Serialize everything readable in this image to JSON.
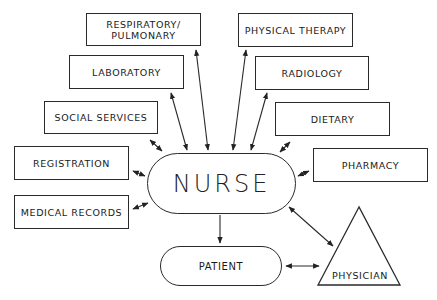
{
  "diagram": {
    "center": {
      "label": "NURSE"
    },
    "departments": [
      {
        "id": "respiratory",
        "label": "RESPIRATORY/ PULMONARY",
        "line1": "RESPIRATORY/",
        "line2": "PULMONARY"
      },
      {
        "id": "laboratory",
        "label": "LABORATORY"
      },
      {
        "id": "social-services",
        "label": "SOCIAL SERVICES"
      },
      {
        "id": "registration",
        "label": "REGISTRATION"
      },
      {
        "id": "medical-records",
        "label": "MEDICAL RECORDS"
      },
      {
        "id": "physical-therapy",
        "label": "PHYSICAL THERAPY"
      },
      {
        "id": "radiology",
        "label": "RADIOLOGY"
      },
      {
        "id": "dietary",
        "label": "DIETARY"
      },
      {
        "id": "pharmacy",
        "label": "PHARMACY"
      }
    ],
    "patient": {
      "label": "PATIENT"
    },
    "physician": {
      "label": "PHYSICIAN"
    },
    "connections": [
      {
        "from": "NURSE",
        "to": "RESPIRATORY/PULMONARY",
        "type": "bidirectional"
      },
      {
        "from": "NURSE",
        "to": "LABORATORY",
        "type": "bidirectional"
      },
      {
        "from": "NURSE",
        "to": "SOCIAL SERVICES",
        "type": "bidirectional"
      },
      {
        "from": "NURSE",
        "to": "REGISTRATION",
        "type": "bidirectional"
      },
      {
        "from": "NURSE",
        "to": "MEDICAL RECORDS",
        "type": "bidirectional"
      },
      {
        "from": "NURSE",
        "to": "PHYSICAL THERAPY",
        "type": "bidirectional"
      },
      {
        "from": "NURSE",
        "to": "RADIOLOGY",
        "type": "bidirectional"
      },
      {
        "from": "NURSE",
        "to": "DIETARY",
        "type": "bidirectional"
      },
      {
        "from": "NURSE",
        "to": "PHARMACY",
        "type": "bidirectional"
      },
      {
        "from": "NURSE",
        "to": "PHYSICIAN",
        "type": "bidirectional"
      },
      {
        "from": "NURSE",
        "to": "PATIENT",
        "type": "directed"
      },
      {
        "from": "PATIENT",
        "to": "PHYSICIAN",
        "type": "bidirectional"
      }
    ]
  },
  "colors": {
    "line": "#2a2a2a",
    "background": "#ffffff"
  }
}
